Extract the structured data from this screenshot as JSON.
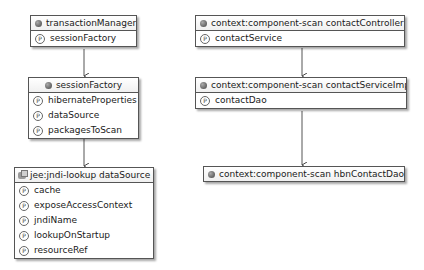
{
  "beans": {
    "transactionManager": {
      "name": "transactionManager",
      "properties": [
        "sessionFactory"
      ]
    },
    "sessionFactory": {
      "name": "sessionFactory",
      "properties": [
        "hibernateProperties",
        "dataSource",
        "packagesToScan"
      ]
    },
    "dataSource": {
      "name": "jee:jndi-lookup dataSource",
      "properties": [
        "cache",
        "exposeAccessContext",
        "jndiName",
        "lookupOnStartup",
        "resourceRef"
      ]
    },
    "contactController": {
      "name": "context:component-scan contactController",
      "properties": [
        "contactService"
      ]
    },
    "contactServiceImpl": {
      "name": "context:component-scan contactServiceImpl",
      "properties": [
        "contactDao"
      ]
    },
    "hbnContactDao": {
      "name": "context:component-scan hbnContactDao",
      "properties": []
    }
  },
  "icons": {
    "bean": "bean-icon",
    "jndi": "jndi-lookup-icon",
    "property": "property-icon",
    "property_glyph": "P"
  },
  "edges": [
    {
      "from": "transactionManager",
      "to": "sessionFactory"
    },
    {
      "from": "sessionFactory",
      "to": "dataSource"
    },
    {
      "from": "contactController",
      "to": "contactServiceImpl"
    },
    {
      "from": "contactServiceImpl",
      "to": "hbnContactDao"
    }
  ]
}
